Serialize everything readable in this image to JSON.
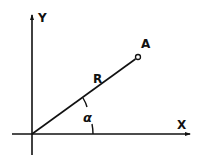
{
  "diagram": {
    "type": "polar-coordinate-diagram",
    "axes": {
      "x_label": "X",
      "y_label": "Y"
    },
    "point": {
      "label": "A"
    },
    "radius": {
      "label": "R"
    },
    "angle": {
      "label": "α"
    },
    "colors": {
      "stroke": "#111111",
      "background": "#ffffff"
    }
  }
}
